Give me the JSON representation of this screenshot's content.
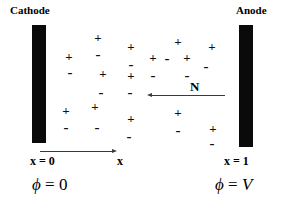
{
  "figure": {
    "type": "electrochemical-cell-diagram",
    "background_color": "#ffffff",
    "ink_color": "#000000",
    "width": 284,
    "height": 207
  },
  "electrodes": [
    {
      "id": "cathode",
      "label": "Cathode",
      "label_x": 10,
      "label_y": 4,
      "bar_x": 32,
      "bar_y": 25,
      "bar_w": 14,
      "bar_h": 118,
      "color": "#0a0a0a"
    },
    {
      "id": "anode",
      "label": "Anode",
      "label_x": 236,
      "label_y": 4,
      "bar_x": 239,
      "bar_y": 25,
      "bar_w": 14,
      "bar_h": 122,
      "color": "#0a0a0a"
    }
  ],
  "axis": {
    "line_x": 40,
    "line_y": 151,
    "line_w": 72,
    "arrow_direction": "right",
    "origin_label": "x = 0",
    "origin_label_x": 30,
    "origin_label_y": 155,
    "variable_label": "x",
    "variable_label_x": 117,
    "variable_label_y": 155,
    "end_label": "x = 1",
    "end_label_x": 224,
    "end_label_y": 155
  },
  "flux_arrow": {
    "label": "N",
    "label_x": 190,
    "label_y": 80,
    "line_x": 152,
    "line_y": 95,
    "line_w": 73,
    "arrow_direction": "left"
  },
  "potentials": [
    {
      "id": "cathode-potential",
      "symbol": "ϕ",
      "equals": "=",
      "value": "0",
      "x": 32,
      "y": 175
    },
    {
      "id": "anode-potential",
      "symbol": "ϕ",
      "equals": "=",
      "value": "V",
      "x": 215,
      "y": 175
    }
  ],
  "charges": [
    {
      "sign": "+",
      "x": 98,
      "y": 37
    },
    {
      "sign": "+",
      "x": 131,
      "y": 46
    },
    {
      "sign": "+",
      "x": 178,
      "y": 41
    },
    {
      "sign": "+",
      "x": 212,
      "y": 46
    },
    {
      "sign": "+",
      "x": 69,
      "y": 56
    },
    {
      "sign": "-",
      "x": 98,
      "y": 54
    },
    {
      "sign": "+",
      "x": 153,
      "y": 57
    },
    {
      "sign": "-",
      "x": 167,
      "y": 58
    },
    {
      "sign": "+",
      "x": 187,
      "y": 57
    },
    {
      "sign": "-",
      "x": 70,
      "y": 72
    },
    {
      "sign": "+",
      "x": 103,
      "y": 73
    },
    {
      "sign": "-",
      "x": 131,
      "y": 64
    },
    {
      "sign": "+",
      "x": 131,
      "y": 75
    },
    {
      "sign": "-",
      "x": 153,
      "y": 75
    },
    {
      "sign": "-",
      "x": 206,
      "y": 66
    },
    {
      "sign": "-",
      "x": 187,
      "y": 75
    },
    {
      "sign": "-",
      "x": 101,
      "y": 92
    },
    {
      "sign": "-",
      "x": 130,
      "y": 92
    },
    {
      "sign": "+",
      "x": 66,
      "y": 110
    },
    {
      "sign": "+",
      "x": 95,
      "y": 106
    },
    {
      "sign": "+",
      "x": 131,
      "y": 118
    },
    {
      "sign": "+",
      "x": 178,
      "y": 112
    },
    {
      "sign": "-",
      "x": 66,
      "y": 127
    },
    {
      "sign": "-",
      "x": 97,
      "y": 127
    },
    {
      "sign": "-",
      "x": 129,
      "y": 136
    },
    {
      "sign": "-",
      "x": 178,
      "y": 130
    },
    {
      "sign": "+",
      "x": 213,
      "y": 128
    },
    {
      "sign": "-",
      "x": 212,
      "y": 143
    }
  ]
}
